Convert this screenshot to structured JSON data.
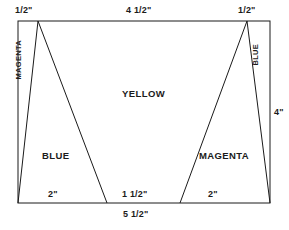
{
  "diagram": {
    "stroke_color": "#1a1a1a",
    "fill_color": "#ffffff",
    "regions": {
      "left_sliver": "MAGENTA",
      "left_triangle": "BLUE",
      "center": "YELLOW",
      "right_triangle": "MAGENTA",
      "right_sliver": "BLUE"
    },
    "dimensions": {
      "top_left": "1/2\"",
      "top_center": "4 1/2\"",
      "top_right": "1/2\"",
      "right_side": "4\"",
      "bottom_left": "2\"",
      "bottom_center": "1 1/2\"",
      "bottom_right": "2\"",
      "bottom_overall": "5 1/2\""
    }
  }
}
